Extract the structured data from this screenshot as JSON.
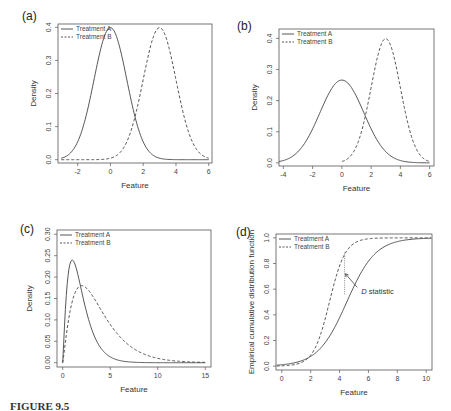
{
  "chart_data": [
    {
      "panel": "(a)",
      "type": "line",
      "xlabel": "Feature",
      "ylabel": "Density",
      "xlim": [
        -3.2,
        6.2
      ],
      "ylim": [
        -0.01,
        0.41
      ],
      "xticks": [
        -2,
        0,
        2,
        4,
        6
      ],
      "yticks": [
        0.0,
        0.1,
        0.2,
        0.3,
        0.4
      ],
      "legend": [
        "Treatment A",
        "Treatment B"
      ],
      "legend_position": "top-left",
      "series": [
        {
          "name": "Treatment A",
          "style": "solid",
          "distribution": "normal",
          "mean": 0,
          "sd": 1,
          "x_range": [
            -3,
            6
          ]
        },
        {
          "name": "Treatment B",
          "style": "dashed",
          "distribution": "normal",
          "mean": 3,
          "sd": 1,
          "x_range": [
            -3,
            6
          ]
        }
      ]
    },
    {
      "panel": "(b)",
      "type": "line",
      "xlabel": "Feature",
      "ylabel": "Density",
      "xlim": [
        -4.3,
        6.3
      ],
      "ylim": [
        -0.01,
        0.43
      ],
      "xticks": [
        -4,
        -2,
        0,
        2,
        4,
        6
      ],
      "yticks": [
        0.0,
        0.1,
        0.2,
        0.3,
        0.4
      ],
      "legend": [
        "Treatment A",
        "Treatment B"
      ],
      "legend_position": "top-left",
      "series": [
        {
          "name": "Treatment A",
          "style": "solid",
          "distribution": "normal",
          "mean": 0,
          "sd": 1.5,
          "x_range": [
            -4.3,
            6
          ]
        },
        {
          "name": "Treatment B",
          "style": "dashed",
          "distribution": "normal",
          "mean": 3,
          "sd": 1,
          "x_range": [
            0,
            6
          ]
        }
      ]
    },
    {
      "panel": "(c)",
      "type": "line",
      "xlabel": "Feature",
      "ylabel": "Density",
      "xlim": [
        -0.6,
        15.6
      ],
      "ylim": [
        -0.01,
        0.31
      ],
      "xticks": [
        0,
        5,
        10,
        15
      ],
      "yticks": [
        0.0,
        0.05,
        0.1,
        0.15,
        0.2,
        0.25,
        0.3
      ],
      "legend": [
        "Treatment A",
        "Treatment B"
      ],
      "legend_position": "top-left",
      "series": [
        {
          "name": "Treatment A",
          "style": "solid",
          "distribution": "right-skewed",
          "peak_x": 1.0,
          "peak_y": 0.24,
          "x_range": [
            0,
            15
          ]
        },
        {
          "name": "Treatment B",
          "style": "dashed",
          "distribution": "right-skewed",
          "peak_x": 2.0,
          "peak_y": 0.18,
          "x_range": [
            0,
            15
          ]
        }
      ]
    },
    {
      "panel": "(d)",
      "type": "line",
      "xlabel": "Feature",
      "ylabel": "Empirical cumulative distribution function",
      "xlim": [
        -0.4,
        10.4
      ],
      "ylim": [
        -0.03,
        1.03
      ],
      "xticks": [
        0,
        2,
        4,
        6,
        8,
        10
      ],
      "yticks": [
        0.0,
        0.2,
        0.4,
        0.6,
        0.8,
        1.0
      ],
      "legend": [
        "Treatment A",
        "Treatment B"
      ],
      "legend_position": "top-left",
      "series": [
        {
          "name": "Treatment A",
          "style": "solid",
          "distribution": "logistic-cdf",
          "midpoint": 4.5,
          "scale": 1.0
        },
        {
          "name": "Treatment B",
          "style": "dashed",
          "distribution": "logistic-cdf",
          "midpoint": 3.3,
          "scale": 0.55
        }
      ],
      "annotations": [
        {
          "text": "D statistic",
          "x": 5.5,
          "y": 0.56,
          "arrow_to_x": 4.4,
          "arrow_to_y": 0.72,
          "italic_prefix": "D"
        },
        {
          "type": "dotted-vertical",
          "x": 4.35,
          "y_from": 0.56,
          "y_to": 0.89
        }
      ]
    }
  ],
  "panels": {
    "a": {
      "label": "(a)",
      "xlabel": "Feature",
      "ylabel": "Density",
      "legend_a": "Treatment A",
      "legend_b": "Treatment B"
    },
    "b": {
      "label": "(b)",
      "xlabel": "Feature",
      "ylabel": "Density",
      "legend_a": "Treatment A",
      "legend_b": "Treatment B"
    },
    "c": {
      "label": "(c)",
      "xlabel": "Feature",
      "ylabel": "Density",
      "legend_a": "Treatment A",
      "legend_b": "Treatment B"
    },
    "d": {
      "label": "(d)",
      "xlabel": "Feature",
      "ylabel": "Empirical cumulative distribution function",
      "legend_a": "Treatment A",
      "legend_b": "Treatment B",
      "annotation_italic": "D",
      "annotation_rest": " statistic"
    }
  },
  "caption": {
    "label": "FIGURE 9.5"
  }
}
